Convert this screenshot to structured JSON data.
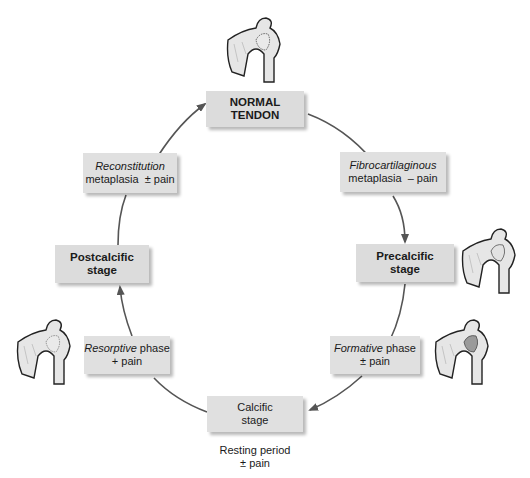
{
  "diagram": {
    "type": "cycle",
    "nodes": {
      "normal_tendon": {
        "line1": "NORMAL",
        "line2": "TENDON"
      },
      "fibrocartilaginous": {
        "italic": "Fibrocartilaginous",
        "rest": "metaplasia  – pain"
      },
      "precalcific": {
        "line1": "Precalcific",
        "line2": "stage"
      },
      "formative": {
        "italic": "Formative",
        "rest_inline": " phase",
        "line2": "± pain"
      },
      "calcific": {
        "line1": "Calcific",
        "line2": "stage"
      },
      "resting": {
        "line1": "Resting period",
        "line2": "± pain"
      },
      "resorptive": {
        "italic": "Resorptive",
        "rest_inline": " phase",
        "line2": "+ pain"
      },
      "postcalcific": {
        "line1": "Postcalcific",
        "line2": "stage"
      },
      "reconstitution": {
        "italic": "Reconstitution",
        "rest": "metaplasia  ± pain"
      }
    },
    "illustrations": [
      {
        "name": "shoulder-normal",
        "position": "top"
      },
      {
        "name": "shoulder-precalcific",
        "position": "right-upper"
      },
      {
        "name": "shoulder-formative",
        "position": "right-lower"
      },
      {
        "name": "shoulder-resorptive",
        "position": "left-lower"
      }
    ],
    "colors": {
      "box": "#dcdcdc",
      "arrow": "#555555",
      "bone_fill": "#e6e6e6",
      "calcium": "#9a9a9a"
    }
  }
}
